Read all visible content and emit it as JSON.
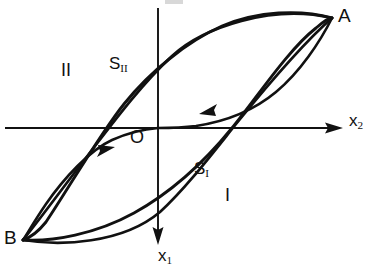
{
  "figure": {
    "type": "phase-portrait",
    "background_color": "#ffffff",
    "stroke_color": "#111111"
  },
  "axes": {
    "horizontal": {
      "label": "x",
      "subscript": "2",
      "direction": "right",
      "arrow": true,
      "y_pixel": 128,
      "x_start": 5,
      "x_end": 325
    },
    "vertical": {
      "label": "x",
      "subscript": "1",
      "direction": "down",
      "arrow": true,
      "x_pixel": 158,
      "y_start": 8,
      "y_end": 240
    },
    "origin_label": "O"
  },
  "points": [
    {
      "name": "A",
      "label": "A",
      "x": 332,
      "y": 18,
      "role": "upper-right cusp"
    },
    {
      "name": "B",
      "label": "B",
      "x": 23,
      "y": 240,
      "role": "lower-left cusp"
    },
    {
      "name": "O",
      "label": "O",
      "x": 158,
      "y": 128,
      "role": "origin"
    }
  ],
  "curves": [
    {
      "name": "S_I",
      "label": "S",
      "subscript": "I",
      "role": "lower branch of slow manifold",
      "label_x": 194,
      "label_y": 160
    },
    {
      "name": "S_II",
      "label": "S",
      "subscript": "II",
      "role": "upper branch of slow manifold",
      "label_x": 109,
      "label_y": 55
    }
  ],
  "regions": [
    {
      "name": "region-one",
      "label": "I",
      "x": 225,
      "y": 186
    },
    {
      "name": "region-two",
      "label": "II",
      "x": 61,
      "y": 61
    }
  ],
  "flow_arrows": [
    {
      "name": "upper-flow-arrow",
      "x": 208,
      "y": 111,
      "direction": "left-down",
      "on_curve": "inner-upper"
    },
    {
      "name": "lower-flow-arrow",
      "x": 106,
      "y": 153,
      "direction": "right-up",
      "on_curve": "inner-lower"
    }
  ]
}
